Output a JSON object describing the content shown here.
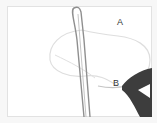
{
  "image": {
    "description": "Photo of a knot-tying illustration: a rope loop with a traced figure path, labeled points A and B, held by a hand",
    "labels": [
      {
        "id": "A",
        "text": "A"
      },
      {
        "id": "B",
        "text": "B"
      }
    ],
    "colors": {
      "background": "#ffffff",
      "rope": "#8a8a8a",
      "trace": "#d6d6d6",
      "hand": "#3a3a3a",
      "frame": "#e2e2e2"
    }
  }
}
